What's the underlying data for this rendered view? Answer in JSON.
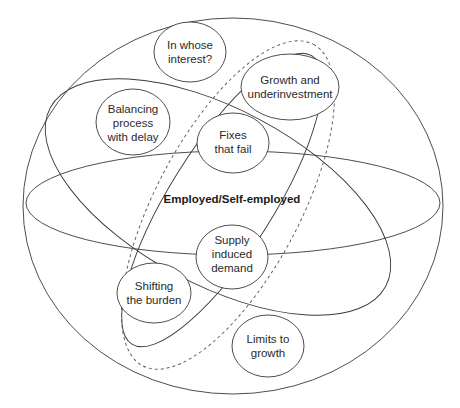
{
  "diagram": {
    "center_label": "Employed/Self-employed",
    "nodes": [
      {
        "id": "in-whose-interest",
        "lines": [
          "In whose",
          "interest?"
        ]
      },
      {
        "id": "growth-and-underinvestment",
        "lines": [
          "Growth and",
          "underinvestment"
        ]
      },
      {
        "id": "balancing-process-with-delay",
        "lines": [
          "Balancing",
          "process",
          "with delay"
        ]
      },
      {
        "id": "fixes-that-fail",
        "lines": [
          "Fixes",
          "that fail"
        ]
      },
      {
        "id": "supply-induced-demand",
        "lines": [
          "Supply",
          "induced",
          "demand"
        ]
      },
      {
        "id": "shifting-the-burden",
        "lines": [
          "Shifting",
          "the burden"
        ]
      },
      {
        "id": "limits-to-growth",
        "lines": [
          "Limits to",
          "growth"
        ]
      }
    ]
  }
}
